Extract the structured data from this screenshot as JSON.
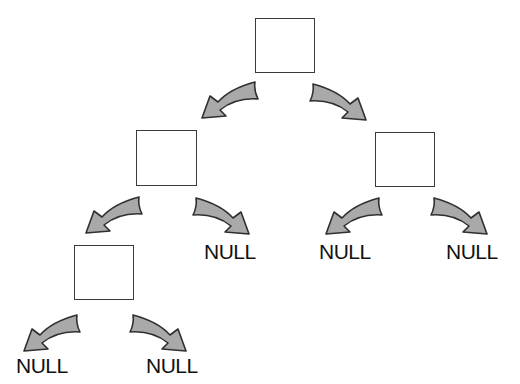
{
  "diagram": {
    "type": "binary-tree",
    "colors": {
      "node_border": "#3a3a3a",
      "node_fill": "#ffffff",
      "arrow_fill": "#a9a9a9",
      "arrow_stroke": "#2f2f2f",
      "text": "#111111"
    },
    "nodes": [
      {
        "id": "root",
        "level": 0
      },
      {
        "id": "root-left",
        "level": 1
      },
      {
        "id": "root-right",
        "level": 1
      },
      {
        "id": "root-left-left",
        "level": 2
      }
    ],
    "null_labels": [
      {
        "id": "null-root-left-right",
        "text": "NULL"
      },
      {
        "id": "null-root-right-left",
        "text": "NULL"
      },
      {
        "id": "null-root-right-right",
        "text": "NULL"
      },
      {
        "id": "null-root-left-left-left",
        "text": "NULL"
      },
      {
        "id": "null-root-left-left-right",
        "text": "NULL"
      }
    ],
    "edges": [
      {
        "from": "root",
        "to": "root-left",
        "direction": "left"
      },
      {
        "from": "root",
        "to": "root-right",
        "direction": "right"
      },
      {
        "from": "root-left",
        "to": "root-left-left",
        "direction": "left"
      },
      {
        "from": "root-left",
        "to": "NULL",
        "direction": "right"
      },
      {
        "from": "root-right",
        "to": "NULL",
        "direction": "left"
      },
      {
        "from": "root-right",
        "to": "NULL",
        "direction": "right"
      },
      {
        "from": "root-left-left",
        "to": "NULL",
        "direction": "left"
      },
      {
        "from": "root-left-left",
        "to": "NULL",
        "direction": "right"
      }
    ]
  }
}
